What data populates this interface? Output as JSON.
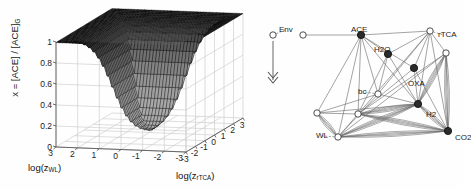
{
  "figure": {
    "panels": [
      "surface-plot",
      "network-diagram"
    ],
    "background_color": "#fefefe",
    "line_color": "#555555",
    "mesh_color": "#1a1a1a"
  },
  "chart_data": {
    "type": "surface",
    "title": "",
    "zlabel_parts": {
      "prefix": "x = [ACE] / [ACE]",
      "subscript": "G"
    },
    "zlabel": "x = [ACE] / [ACE]G",
    "xlabel_parts": {
      "prefix": "log(z",
      "subscript": "WL",
      "suffix": ")"
    },
    "xlabel": "log(zWL)",
    "ylabel_parts": {
      "prefix": "log(z",
      "subscript": "rTCA",
      "suffix": ")"
    },
    "ylabel": "log(zrTCA)",
    "zticks": [
      "0",
      "0.2",
      "0.4",
      "0.6",
      "0.8",
      "1"
    ],
    "zlim": [
      0,
      1
    ],
    "xticks": [
      "3",
      "2",
      "1",
      "0",
      "-1",
      "-2",
      "-3"
    ],
    "xlim": [
      -3,
      3
    ],
    "yticks": [
      "-3",
      "-2",
      "-1",
      "0",
      "1",
      "2",
      "3"
    ],
    "ylim": [
      -3,
      3
    ],
    "grid": true,
    "surface_values": {
      "corner_back": 1.0,
      "corner_left": 1.0,
      "corner_right": 1.0,
      "center_basin": 0.05,
      "front_min": 0.0
    }
  },
  "network": {
    "type": "graph",
    "nodes": [
      {
        "id": "env",
        "label": "Env",
        "x": 23,
        "y": 35,
        "fill": "open",
        "label_dx": 6,
        "label_dy": -9
      },
      {
        "id": "n_env2",
        "label": "",
        "x": 53,
        "y": 35,
        "fill": "open",
        "label_dx": 0,
        "label_dy": 0
      },
      {
        "id": "ace",
        "label": "ACE",
        "x": 111,
        "y": 35,
        "fill": "filled",
        "label_dx": -10,
        "label_dy": -9
      },
      {
        "id": "rtca",
        "label": "rTCA",
        "x": 180,
        "y": 31,
        "fill": "open",
        "label_dx": 8,
        "label_dy": 0
      },
      {
        "id": "h2o",
        "label": "H2O",
        "x": 138,
        "y": 54,
        "fill": "filled",
        "label_dx": -14,
        "label_dy": -8
      },
      {
        "id": "hub_r",
        "label": "",
        "x": 196,
        "y": 53,
        "fill": "open",
        "label_dx": 0,
        "label_dy": 0
      },
      {
        "id": "oxa",
        "label": "OXA",
        "x": 164,
        "y": 68,
        "fill": "filled",
        "label_dx": -6,
        "label_dy": 12
      },
      {
        "id": "bc",
        "label": "bc",
        "x": 128,
        "y": 94,
        "fill": "open",
        "label_dx": -20,
        "label_dy": -6
      },
      {
        "id": "h2",
        "label": "H2",
        "x": 168,
        "y": 104,
        "fill": "filled",
        "label_dx": 8,
        "label_dy": 7
      },
      {
        "id": "hub_l",
        "label": "",
        "x": 67,
        "y": 113,
        "fill": "open",
        "label_dx": 0,
        "label_dy": 0
      },
      {
        "id": "hub_c",
        "label": "",
        "x": 108,
        "y": 114,
        "fill": "open",
        "label_dx": 0,
        "label_dy": 0
      },
      {
        "id": "co2",
        "label": "CO2",
        "x": 198,
        "y": 131,
        "fill": "filled",
        "label_dx": 7,
        "label_dy": 3
      },
      {
        "id": "wl",
        "label": "WL",
        "x": 88,
        "y": 137,
        "fill": "open",
        "label_dx": -22,
        "label_dy": -5
      }
    ],
    "arrow": {
      "name": "env-downward-arrow",
      "from_x": 23,
      "from_y": 41,
      "to_y": 80
    },
    "label_connectors": [
      {
        "from": "env",
        "style": "dashed"
      },
      {
        "from": "rtca",
        "style": "dashed"
      },
      {
        "from": "bc",
        "style": "dashed"
      },
      {
        "from": "wl",
        "style": "dashed"
      }
    ],
    "edges": [
      [
        "n_env2",
        "ace"
      ],
      [
        "ace",
        "rtca"
      ],
      [
        "ace",
        "h2o"
      ],
      [
        "ace",
        "oxa"
      ],
      [
        "ace",
        "bc"
      ],
      [
        "ace",
        "hub_l"
      ],
      [
        "ace",
        "hub_c"
      ],
      [
        "ace",
        "wl"
      ],
      [
        "ace",
        "h2"
      ],
      [
        "rtca",
        "hub_r"
      ],
      [
        "rtca",
        "h2o"
      ],
      [
        "rtca",
        "oxa"
      ],
      [
        "rtca",
        "h2"
      ],
      [
        "rtca",
        "bc"
      ],
      [
        "rtca",
        "hub_c"
      ],
      [
        "rtca",
        "co2"
      ],
      [
        "h2o",
        "bc"
      ],
      [
        "h2o",
        "hub_c"
      ],
      [
        "h2o",
        "h2"
      ],
      [
        "oxa",
        "h2"
      ],
      [
        "oxa",
        "co2"
      ],
      [
        "oxa",
        "hub_c"
      ],
      [
        "hub_r",
        "h2"
      ],
      [
        "hub_r",
        "co2"
      ],
      [
        "hub_r",
        "wl"
      ],
      [
        "hub_r",
        "hub_c"
      ],
      [
        "bc",
        "hub_l"
      ],
      [
        "bc",
        "wl"
      ],
      [
        "bc",
        "h2"
      ],
      [
        "hub_l",
        "wl"
      ],
      [
        "hub_l",
        "hub_c"
      ],
      [
        "hub_l",
        "h2"
      ],
      [
        "hub_c",
        "h2"
      ],
      [
        "hub_c",
        "co2"
      ],
      [
        "hub_c",
        "wl"
      ],
      [
        "h2",
        "co2"
      ],
      [
        "h2",
        "wl"
      ],
      [
        "co2",
        "wl"
      ]
    ],
    "multi_edges": [
      [
        "hub_r",
        "h2"
      ],
      [
        "hub_r",
        "co2"
      ],
      [
        "h2",
        "wl"
      ],
      [
        "co2",
        "wl"
      ],
      [
        "hub_c",
        "h2"
      ],
      [
        "hub_c",
        "co2"
      ],
      [
        "h2",
        "co2"
      ],
      [
        "hub_l",
        "wl"
      ]
    ]
  }
}
